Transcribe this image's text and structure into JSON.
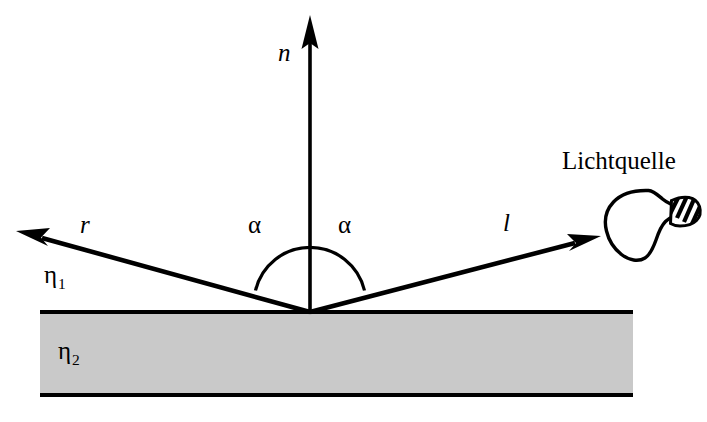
{
  "figure": {
    "language": "de",
    "background_color": "#ffffff",
    "stroke_color": "#000000",
    "slab_fill_color": "#c9c9c9"
  },
  "labels": {
    "normal": "n",
    "reflected_ray": "r",
    "light_ray": "l",
    "light_source": "Lichtquelle",
    "angle_left": "α",
    "angle_right": "α",
    "medium_upper_symbol": "η",
    "medium_upper_subscript": "1",
    "medium_lower_symbol": "η",
    "medium_lower_subscript": "2"
  },
  "geometry": {
    "origin_x": 310,
    "origin_y": 312,
    "normal_tip_x": 310,
    "normal_tip_y": 16,
    "reflected_tip_x": 17,
    "reflected_tip_y": 231,
    "light_tip_x": 600,
    "light_tip_y": 236,
    "arc_radius": 56,
    "slab_left": 40,
    "slab_right": 633,
    "slab_top": 311,
    "slab_bottom": 396,
    "bulb_center_x": 651,
    "bulb_center_y": 223
  },
  "icons": {
    "light_bulb": "light-bulb-icon",
    "arrow_head": "arrow-head-icon"
  }
}
